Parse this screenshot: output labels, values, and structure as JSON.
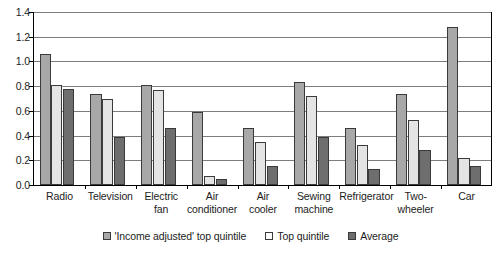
{
  "chart_data": {
    "type": "bar",
    "title": "",
    "subtitle": "",
    "xlabel": "",
    "ylabel": "",
    "ylim": [
      0.0,
      1.4
    ],
    "ytick_labels": [
      "1.4",
      "1.2",
      "1.0",
      "0.8",
      "0.6",
      "0.4",
      "0.2",
      "0.0"
    ],
    "ytick_values": [
      1.4,
      1.2,
      1.0,
      0.8,
      0.6,
      0.4,
      0.2,
      0.0
    ],
    "grid": true,
    "legend_position": "bottom",
    "categories": [
      "Radio",
      "Television",
      "Electric fan",
      "Air conditioner",
      "Air cooler",
      "Sewing machine",
      "Refrigerator",
      "Two-wheeler",
      "Car"
    ],
    "category_lines": [
      [
        "Radio"
      ],
      [
        "Television"
      ],
      [
        "Electric",
        "fan"
      ],
      [
        "Air",
        "conditioner"
      ],
      [
        "Air",
        "cooler"
      ],
      [
        "Sewing",
        "machine"
      ],
      [
        "Refrigerator"
      ],
      [
        "Two-",
        "wheeler"
      ],
      [
        "Car"
      ]
    ],
    "series": [
      {
        "name": "'Income adjusted' top quintile",
        "color": "#a8a8a8",
        "values": [
          1.06,
          0.74,
          0.81,
          0.59,
          0.46,
          0.83,
          0.46,
          0.74,
          1.28
        ]
      },
      {
        "name": "Top quintile",
        "color": "#e4e4e4",
        "values": [
          0.81,
          0.7,
          0.77,
          0.07,
          0.35,
          0.72,
          0.32,
          0.53,
          0.22
        ]
      },
      {
        "name": "Average",
        "color": "#6e6e6e",
        "values": [
          0.78,
          0.39,
          0.46,
          0.05,
          0.15,
          0.39,
          0.13,
          0.28,
          0.15
        ]
      }
    ]
  },
  "legend": {
    "items": [
      {
        "label": "'Income adjusted' top quintile",
        "swatch": "s0"
      },
      {
        "label": "Top quintile",
        "swatch": "s1"
      },
      {
        "label": "Average",
        "swatch": "s2"
      }
    ]
  }
}
